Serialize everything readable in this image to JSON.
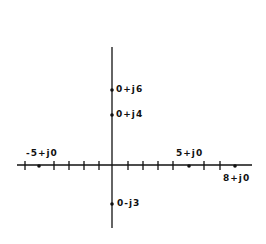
{
  "diagram": {
    "type": "complex-plane",
    "points": [
      {
        "label": "0+j6",
        "re": 0,
        "im": 6
      },
      {
        "label": "0+j4",
        "re": 0,
        "im": 4
      },
      {
        "label": "-5+j0",
        "re": -5,
        "im": 0
      },
      {
        "label": "5+j0",
        "re": 5,
        "im": 0
      },
      {
        "label": "8+j0",
        "re": 8,
        "im": 0
      },
      {
        "label": "0-j3",
        "re": 0,
        "im": -3
      }
    ],
    "colors": {
      "ink": "#111111",
      "background": "#ffffff"
    }
  }
}
